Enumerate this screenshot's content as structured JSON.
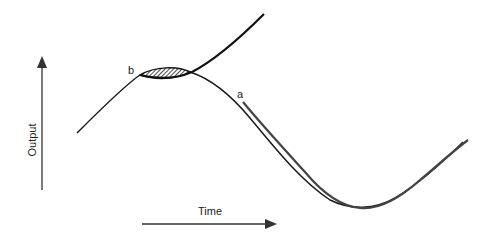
{
  "diagram": {
    "type": "curve-approximation",
    "axes": {
      "y_label": "Output",
      "x_label": "Time"
    },
    "points": {
      "b": "b",
      "a": "a"
    },
    "colors": {
      "stroke": "#1a1a1a",
      "curve_gray": "#3a3a3a",
      "background": "#ffffff"
    }
  }
}
